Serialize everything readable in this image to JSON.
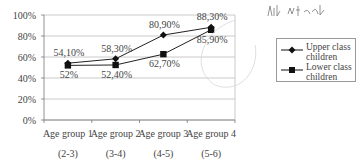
{
  "chart_data": {
    "type": "line",
    "title": "",
    "xlabel": "",
    "ylabel": "",
    "ylim": [
      0,
      100
    ],
    "yticks": [
      "0%",
      "20%",
      "40%",
      "60%",
      "80%",
      "100%"
    ],
    "grid": true,
    "legend_position": "right",
    "categories": [
      "Age group 1",
      "Age group 2",
      "Age group 3",
      "Age group 4"
    ],
    "category_sublabels": [
      "(2-3)",
      "(3-4)",
      "(4-5)",
      "(5-6)"
    ],
    "series": [
      {
        "name": "Upper class children",
        "marker": "diamond",
        "values": [
          54.1,
          58.3,
          80.9,
          88.3
        ],
        "labels": [
          "54,10%",
          "58,30%",
          "80,90%",
          "88,30%"
        ]
      },
      {
        "name": "Lower class children",
        "marker": "square",
        "values": [
          52,
          52.4,
          62.7,
          85.9
        ],
        "labels": [
          "52%",
          "52,40%",
          "62,70%",
          "85,90%"
        ]
      }
    ],
    "annotations": [
      "handwritten scribble near top right",
      "faint hand-drawn circle around last data points"
    ]
  },
  "legend": {
    "items": [
      {
        "label_line1": "Upper class",
        "label_line2": "children"
      },
      {
        "label_line1": "Lower class",
        "label_line2": "children"
      }
    ]
  }
}
